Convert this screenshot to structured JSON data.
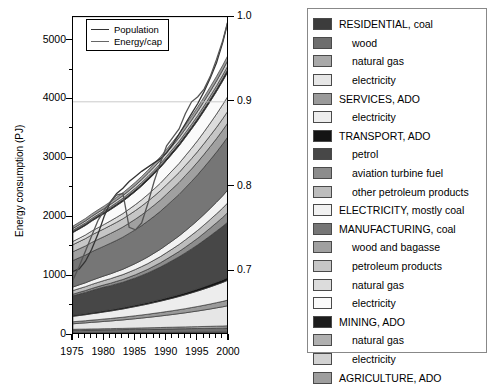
{
  "chart_data": {
    "type": "area",
    "title": "",
    "xlabel": "",
    "ylabel": "Energy consumption (PJ)",
    "xlim": [
      1975,
      2000
    ],
    "ylim": [
      0,
      5400
    ],
    "y_ticks": [
      0,
      1000,
      2000,
      3000,
      4000,
      5000
    ],
    "x_ticks": [
      1975,
      1980,
      1985,
      1990,
      1995,
      2000
    ],
    "x_minor_tick_step": 1,
    "y_minor_tick_step": 500,
    "grid": false,
    "legend_position": "right-outside",
    "secondary_axis": {
      "label": "",
      "ylim": [
        0.625,
        1.0
      ],
      "ticks": [
        0.7,
        0.8,
        0.9,
        1.0
      ],
      "tick_labels": [
        "0.7",
        "0.8",
        "0.9",
        "1.0"
      ]
    },
    "x": [
      1975,
      1976,
      1977,
      1978,
      1979,
      1980,
      1981,
      1982,
      1983,
      1984,
      1985,
      1986,
      1987,
      1988,
      1989,
      1990,
      1991,
      1992,
      1993,
      1994,
      1995,
      1996,
      1997,
      1998,
      1999,
      2000
    ],
    "series": [
      {
        "name": "RESIDENTIAL, coal",
        "color": "#3c3c3c",
        "values": [
          36,
          37,
          37,
          38,
          38,
          39,
          39,
          40,
          40,
          41,
          41,
          42,
          42,
          43,
          43,
          44,
          44,
          45,
          45,
          46,
          46,
          47,
          47,
          48,
          48,
          49
        ]
      },
      {
        "name": "wood",
        "color": "#6e6e6e",
        "values": [
          44,
          45,
          46,
          47,
          48,
          49,
          50,
          51,
          52,
          53,
          54,
          55,
          56,
          57,
          58,
          59,
          60,
          61,
          62,
          63,
          64,
          65,
          66,
          67,
          68,
          70
        ]
      },
      {
        "name": "natural gas",
        "color": "#a9a9a9",
        "values": [
          16,
          17,
          17,
          18,
          18,
          19,
          19,
          20,
          20,
          21,
          22,
          23,
          24,
          25,
          26,
          27,
          28,
          29,
          30,
          31,
          32,
          33,
          34,
          35,
          36,
          38
        ]
      },
      {
        "name": "electricity",
        "color": "#e6e6e6",
        "values": [
          95,
          100,
          106,
          112,
          118,
          124,
          130,
          137,
          144,
          152,
          160,
          168,
          177,
          186,
          196,
          206,
          217,
          228,
          240,
          253,
          266,
          280,
          295,
          311,
          327,
          345
        ]
      },
      {
        "name": "SERVICES, ADO",
        "color": "#9a9a9a",
        "values": [
          34,
          35,
          36,
          38,
          39,
          41,
          42,
          44,
          46,
          48,
          50,
          52,
          54,
          57,
          59,
          62,
          64,
          67,
          70,
          73,
          77,
          80,
          84,
          88,
          92,
          96
        ]
      },
      {
        "name": "electricity",
        "color": "#ededed",
        "values": [
          92,
          97,
          102,
          108,
          114,
          120,
          126,
          133,
          140,
          148,
          156,
          164,
          173,
          182,
          192,
          202,
          213,
          224,
          236,
          249,
          262,
          276,
          291,
          306,
          322,
          340
        ]
      },
      {
        "name": "TRANSPORT, ADO",
        "color": "#141414",
        "values": [
          18,
          19,
          19,
          20,
          21,
          22,
          22,
          23,
          24,
          25,
          26,
          27,
          28,
          29,
          30,
          31,
          33,
          34,
          36,
          37,
          39,
          41,
          43,
          45,
          47,
          49
        ]
      },
      {
        "name": "petrol",
        "color": "#474747",
        "values": [
          330,
          345,
          360,
          375,
          390,
          400,
          410,
          420,
          430,
          445,
          460,
          480,
          500,
          525,
          550,
          580,
          610,
          640,
          675,
          710,
          745,
          785,
          825,
          865,
          905,
          950
        ]
      },
      {
        "name": "aviation turbine fuel",
        "color": "#8c8c8c",
        "values": [
          28,
          30,
          32,
          34,
          36,
          38,
          41,
          44,
          47,
          50,
          54,
          58,
          62,
          67,
          72,
          78,
          84,
          90,
          97,
          105,
          113,
          122,
          131,
          141,
          152,
          164
        ]
      },
      {
        "name": "other petroleum products",
        "color": "#bdbdbd",
        "values": [
          62,
          64,
          66,
          69,
          71,
          74,
          77,
          80,
          83,
          86,
          90,
          93,
          97,
          101,
          105,
          110,
          114,
          119,
          124,
          129,
          135,
          140,
          146,
          152,
          159,
          166
        ]
      },
      {
        "name": "ELECTRICITY, mostly coal",
        "color": "#f2f2f2",
        "values": [
          60,
          63,
          66,
          70,
          74,
          78,
          82,
          86,
          91,
          96,
          101,
          106,
          112,
          118,
          124,
          131,
          138,
          145,
          153,
          161,
          170,
          179,
          188,
          198,
          209,
          220
        ]
      },
      {
        "name": "MANUFACTURING, coal",
        "color": "#767676",
        "values": [
          450,
          460,
          470,
          485,
          495,
          505,
          520,
          530,
          545,
          560,
          575,
          590,
          610,
          625,
          645,
          665,
          685,
          705,
          730,
          750,
          775,
          800,
          825,
          850,
          880,
          905
        ]
      },
      {
        "name": "wood and bagasse",
        "color": "#a0a0a0",
        "values": [
          150,
          152,
          155,
          158,
          160,
          163,
          166,
          169,
          172,
          175,
          178,
          182,
          185,
          189,
          192,
          196,
          200,
          204,
          208,
          212,
          216,
          220,
          225,
          229,
          234,
          239
        ]
      },
      {
        "name": "petroleum products",
        "color": "#c6c6c6",
        "values": [
          120,
          122,
          125,
          127,
          130,
          132,
          135,
          138,
          140,
          143,
          146,
          149,
          152,
          155,
          158,
          162,
          165,
          168,
          172,
          176,
          179,
          183,
          187,
          191,
          195,
          199
        ]
      },
      {
        "name": "natural gas",
        "color": "#dcdcdc",
        "values": [
          55,
          58,
          62,
          66,
          70,
          74,
          79,
          84,
          89,
          95,
          101,
          107,
          114,
          121,
          129,
          137,
          146,
          155,
          165,
          176,
          187,
          199,
          212,
          226,
          240,
          256
        ]
      },
      {
        "name": "electricity",
        "color": "#fafafa",
        "values": [
          150,
          156,
          162,
          169,
          176,
          183,
          190,
          198,
          206,
          215,
          224,
          233,
          243,
          253,
          264,
          275,
          287,
          299,
          311,
          325,
          338,
          353,
          368,
          383,
          400,
          417
        ]
      },
      {
        "name": "MINING, ADO",
        "color": "#1c1c1c",
        "values": [
          22,
          23,
          23,
          24,
          25,
          25,
          26,
          27,
          28,
          28,
          29,
          30,
          31,
          32,
          33,
          34,
          35,
          36,
          37,
          38,
          40,
          41,
          42,
          44,
          45,
          47
        ]
      },
      {
        "name": "natural gas",
        "color": "#b0b0b0",
        "values": [
          18,
          19,
          20,
          21,
          22,
          23,
          24,
          25,
          26,
          27,
          28,
          30,
          31,
          32,
          34,
          35,
          37,
          39,
          41,
          43,
          45,
          47,
          49,
          51,
          54,
          56
        ]
      },
      {
        "name": "electricity",
        "color": "#d2d2d2",
        "values": [
          30,
          31,
          33,
          34,
          36,
          37,
          39,
          41,
          43,
          45,
          47,
          49,
          51,
          54,
          56,
          59,
          61,
          64,
          67,
          70,
          74,
          77,
          81,
          84,
          88,
          93
        ]
      },
      {
        "name": "AGRICULTURE, ADO",
        "color": "#9e9e9e",
        "values": [
          40,
          41,
          42,
          43,
          44,
          46,
          47,
          48,
          50,
          51,
          53,
          54,
          56,
          58,
          60,
          61,
          63,
          65,
          67,
          69,
          72,
          74,
          76,
          79,
          81,
          84
        ]
      }
    ],
    "lines": [
      {
        "name": "Population",
        "color": "#333333",
        "axis": "secondary",
        "values": [
          0.7,
          0.703,
          0.712,
          0.726,
          0.744,
          0.765,
          0.782,
          0.792,
          0.798,
          0.806,
          0.812,
          0.818,
          0.823,
          0.828,
          0.833,
          0.84,
          0.85,
          0.862,
          0.874,
          0.886,
          0.898,
          0.912,
          0.928,
          0.946,
          0.97,
          1.0
        ]
      },
      {
        "name": "Energy/cap",
        "color": "#555555",
        "axis": "secondary",
        "values": [
          0.69,
          0.706,
          0.724,
          0.742,
          0.76,
          0.772,
          0.782,
          0.79,
          0.792,
          0.752,
          0.749,
          0.757,
          0.78,
          0.806,
          0.828,
          0.848,
          0.858,
          0.868,
          0.886,
          0.9,
          0.906,
          0.915,
          0.93,
          0.95,
          0.972,
          1.0
        ]
      }
    ]
  },
  "inner_legend": {
    "items": [
      {
        "label": "Population"
      },
      {
        "label": "Energy/cap"
      }
    ]
  },
  "legend_panel": {
    "items": [
      {
        "label": "RESIDENTIAL, coal",
        "color": "#3c3c3c",
        "indent": false
      },
      {
        "label": "wood",
        "color": "#6e6e6e",
        "indent": true
      },
      {
        "label": "natural gas",
        "color": "#a9a9a9",
        "indent": true
      },
      {
        "label": "electricity",
        "color": "#e6e6e6",
        "indent": true
      },
      {
        "label": "SERVICES, ADO",
        "color": "#9a9a9a",
        "indent": false
      },
      {
        "label": "electricity",
        "color": "#ededed",
        "indent": true
      },
      {
        "label": "TRANSPORT, ADO",
        "color": "#141414",
        "indent": false
      },
      {
        "label": "petrol",
        "color": "#474747",
        "indent": true
      },
      {
        "label": "aviation turbine fuel",
        "color": "#8c8c8c",
        "indent": true
      },
      {
        "label": "other petroleum products",
        "color": "#bdbdbd",
        "indent": true
      },
      {
        "label": "ELECTRICITY, mostly coal",
        "color": "#f2f2f2",
        "indent": false
      },
      {
        "label": "MANUFACTURING, coal",
        "color": "#767676",
        "indent": false
      },
      {
        "label": "wood and bagasse",
        "color": "#a0a0a0",
        "indent": true
      },
      {
        "label": "petroleum products",
        "color": "#c6c6c6",
        "indent": true
      },
      {
        "label": "natural gas",
        "color": "#dcdcdc",
        "indent": true
      },
      {
        "label": "electricity",
        "color": "#fafafa",
        "indent": true
      },
      {
        "label": "MINING, ADO",
        "color": "#1c1c1c",
        "indent": false
      },
      {
        "label": "natural gas",
        "color": "#b0b0b0",
        "indent": true
      },
      {
        "label": "electricity",
        "color": "#d2d2d2",
        "indent": true
      },
      {
        "label": "AGRICULTURE, ADO",
        "color": "#9e9e9e",
        "indent": false
      }
    ]
  }
}
